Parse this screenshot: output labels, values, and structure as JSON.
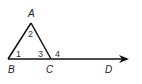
{
  "diagram": {
    "type": "geometry",
    "points": {
      "A": {
        "label": "A",
        "x": 31,
        "y": 23
      },
      "B": {
        "label": "B",
        "x": 8,
        "y": 59
      },
      "C": {
        "label": "C",
        "x": 51,
        "y": 59
      },
      "D": {
        "label": "D",
        "x": 110,
        "y": 59
      }
    },
    "angles": [
      {
        "label": "1",
        "at": "B"
      },
      {
        "label": "2",
        "at": "A"
      },
      {
        "label": "3",
        "at": "C",
        "interior": true
      },
      {
        "label": "4",
        "at": "C",
        "exterior": true
      }
    ],
    "ray": {
      "from": "B",
      "through": "D",
      "arrow": true
    },
    "colors": {
      "stroke": "#111111",
      "text": "#222222"
    }
  }
}
